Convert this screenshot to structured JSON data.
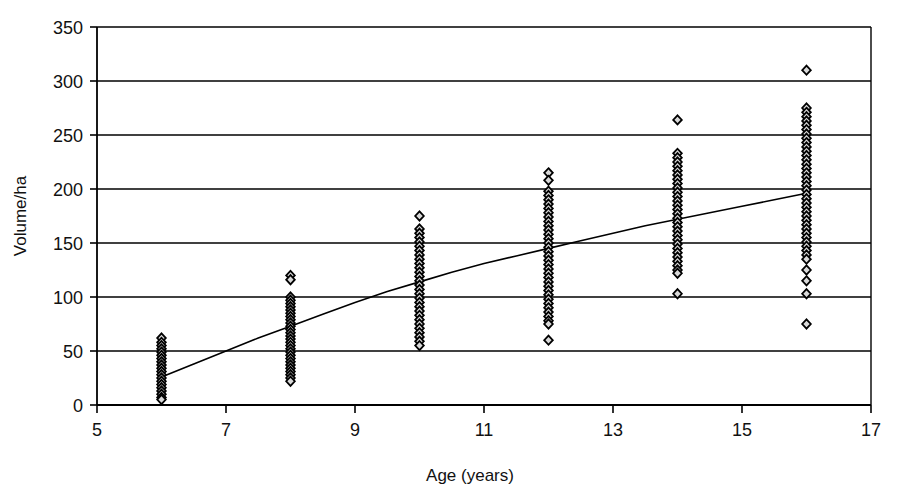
{
  "chart_data": {
    "type": "scatter",
    "title": "",
    "xlabel": "Age (years)",
    "ylabel": "Volume/ha",
    "xlim": [
      5,
      17
    ],
    "ylim": [
      0,
      350
    ],
    "xticks": [
      5,
      7,
      9,
      11,
      13,
      15,
      17
    ],
    "yticks": [
      0,
      50,
      100,
      150,
      200,
      250,
      300,
      350
    ],
    "xtick_labels": [
      "5",
      "7",
      "9",
      "11",
      "13",
      "15",
      "17"
    ],
    "ytick_labels": [
      "0",
      "50",
      "100",
      "150",
      "200",
      "250",
      "300",
      "350"
    ],
    "grid": "horizontal",
    "legend": "none",
    "marker": "diamond",
    "marker_fill": "#d9d9d9",
    "marker_edge": "#000000",
    "axis_color": "#000000",
    "grid_color": "#000000",
    "series": [
      {
        "name": "Volume per hectare by stand age",
        "type": "scatter",
        "points": [
          {
            "x": 6,
            "y": 62
          },
          {
            "x": 6,
            "y": 58
          },
          {
            "x": 6,
            "y": 55
          },
          {
            "x": 6,
            "y": 52
          },
          {
            "x": 6,
            "y": 49
          },
          {
            "x": 6,
            "y": 46
          },
          {
            "x": 6,
            "y": 43
          },
          {
            "x": 6,
            "y": 40
          },
          {
            "x": 6,
            "y": 37
          },
          {
            "x": 6,
            "y": 34
          },
          {
            "x": 6,
            "y": 31
          },
          {
            "x": 6,
            "y": 28
          },
          {
            "x": 6,
            "y": 25
          },
          {
            "x": 6,
            "y": 22
          },
          {
            "x": 6,
            "y": 19
          },
          {
            "x": 6,
            "y": 16
          },
          {
            "x": 6,
            "y": 13
          },
          {
            "x": 6,
            "y": 10
          },
          {
            "x": 6,
            "y": 7
          },
          {
            "x": 6,
            "y": 5
          },
          {
            "x": 8,
            "y": 120
          },
          {
            "x": 8,
            "y": 116
          },
          {
            "x": 8,
            "y": 100
          },
          {
            "x": 8,
            "y": 97
          },
          {
            "x": 8,
            "y": 94
          },
          {
            "x": 8,
            "y": 91
          },
          {
            "x": 8,
            "y": 88
          },
          {
            "x": 8,
            "y": 85
          },
          {
            "x": 8,
            "y": 82
          },
          {
            "x": 8,
            "y": 79
          },
          {
            "x": 8,
            "y": 76
          },
          {
            "x": 8,
            "y": 73
          },
          {
            "x": 8,
            "y": 70
          },
          {
            "x": 8,
            "y": 67
          },
          {
            "x": 8,
            "y": 64
          },
          {
            "x": 8,
            "y": 61
          },
          {
            "x": 8,
            "y": 58
          },
          {
            "x": 8,
            "y": 55
          },
          {
            "x": 8,
            "y": 52
          },
          {
            "x": 8,
            "y": 49
          },
          {
            "x": 8,
            "y": 46
          },
          {
            "x": 8,
            "y": 43
          },
          {
            "x": 8,
            "y": 40
          },
          {
            "x": 8,
            "y": 37
          },
          {
            "x": 8,
            "y": 34
          },
          {
            "x": 8,
            "y": 31
          },
          {
            "x": 8,
            "y": 28
          },
          {
            "x": 8,
            "y": 25
          },
          {
            "x": 8,
            "y": 22
          },
          {
            "x": 10,
            "y": 175
          },
          {
            "x": 10,
            "y": 163
          },
          {
            "x": 10,
            "y": 159
          },
          {
            "x": 10,
            "y": 155
          },
          {
            "x": 10,
            "y": 151
          },
          {
            "x": 10,
            "y": 147
          },
          {
            "x": 10,
            "y": 143
          },
          {
            "x": 10,
            "y": 139
          },
          {
            "x": 10,
            "y": 135
          },
          {
            "x": 10,
            "y": 131
          },
          {
            "x": 10,
            "y": 127
          },
          {
            "x": 10,
            "y": 123
          },
          {
            "x": 10,
            "y": 119
          },
          {
            "x": 10,
            "y": 115
          },
          {
            "x": 10,
            "y": 111
          },
          {
            "x": 10,
            "y": 107
          },
          {
            "x": 10,
            "y": 103
          },
          {
            "x": 10,
            "y": 99
          },
          {
            "x": 10,
            "y": 95
          },
          {
            "x": 10,
            "y": 91
          },
          {
            "x": 10,
            "y": 87
          },
          {
            "x": 10,
            "y": 83
          },
          {
            "x": 10,
            "y": 79
          },
          {
            "x": 10,
            "y": 75
          },
          {
            "x": 10,
            "y": 71
          },
          {
            "x": 10,
            "y": 67
          },
          {
            "x": 10,
            "y": 63
          },
          {
            "x": 10,
            "y": 59
          },
          {
            "x": 10,
            "y": 55
          },
          {
            "x": 12,
            "y": 215
          },
          {
            "x": 12,
            "y": 208
          },
          {
            "x": 12,
            "y": 198
          },
          {
            "x": 12,
            "y": 194
          },
          {
            "x": 12,
            "y": 190
          },
          {
            "x": 12,
            "y": 186
          },
          {
            "x": 12,
            "y": 182
          },
          {
            "x": 12,
            "y": 178
          },
          {
            "x": 12,
            "y": 174
          },
          {
            "x": 12,
            "y": 170
          },
          {
            "x": 12,
            "y": 166
          },
          {
            "x": 12,
            "y": 162
          },
          {
            "x": 12,
            "y": 158
          },
          {
            "x": 12,
            "y": 154
          },
          {
            "x": 12,
            "y": 150
          },
          {
            "x": 12,
            "y": 146
          },
          {
            "x": 12,
            "y": 142
          },
          {
            "x": 12,
            "y": 138
          },
          {
            "x": 12,
            "y": 134
          },
          {
            "x": 12,
            "y": 130
          },
          {
            "x": 12,
            "y": 126
          },
          {
            "x": 12,
            "y": 122
          },
          {
            "x": 12,
            "y": 118
          },
          {
            "x": 12,
            "y": 114
          },
          {
            "x": 12,
            "y": 110
          },
          {
            "x": 12,
            "y": 106
          },
          {
            "x": 12,
            "y": 102
          },
          {
            "x": 12,
            "y": 98
          },
          {
            "x": 12,
            "y": 94
          },
          {
            "x": 12,
            "y": 90
          },
          {
            "x": 12,
            "y": 86
          },
          {
            "x": 12,
            "y": 82
          },
          {
            "x": 12,
            "y": 78
          },
          {
            "x": 12,
            "y": 75
          },
          {
            "x": 12,
            "y": 60
          },
          {
            "x": 14,
            "y": 264
          },
          {
            "x": 14,
            "y": 233
          },
          {
            "x": 14,
            "y": 229
          },
          {
            "x": 14,
            "y": 225
          },
          {
            "x": 14,
            "y": 221
          },
          {
            "x": 14,
            "y": 217
          },
          {
            "x": 14,
            "y": 213
          },
          {
            "x": 14,
            "y": 209
          },
          {
            "x": 14,
            "y": 205
          },
          {
            "x": 14,
            "y": 201
          },
          {
            "x": 14,
            "y": 197
          },
          {
            "x": 14,
            "y": 193
          },
          {
            "x": 14,
            "y": 189
          },
          {
            "x": 14,
            "y": 185
          },
          {
            "x": 14,
            "y": 181
          },
          {
            "x": 14,
            "y": 177
          },
          {
            "x": 14,
            "y": 173
          },
          {
            "x": 14,
            "y": 169
          },
          {
            "x": 14,
            "y": 165
          },
          {
            "x": 14,
            "y": 161
          },
          {
            "x": 14,
            "y": 157
          },
          {
            "x": 14,
            "y": 153
          },
          {
            "x": 14,
            "y": 149
          },
          {
            "x": 14,
            "y": 145
          },
          {
            "x": 14,
            "y": 141
          },
          {
            "x": 14,
            "y": 137
          },
          {
            "x": 14,
            "y": 133
          },
          {
            "x": 14,
            "y": 129
          },
          {
            "x": 14,
            "y": 125
          },
          {
            "x": 14,
            "y": 122
          },
          {
            "x": 14,
            "y": 103
          },
          {
            "x": 16,
            "y": 310
          },
          {
            "x": 16,
            "y": 275
          },
          {
            "x": 16,
            "y": 271
          },
          {
            "x": 16,
            "y": 267
          },
          {
            "x": 16,
            "y": 263
          },
          {
            "x": 16,
            "y": 259
          },
          {
            "x": 16,
            "y": 255
          },
          {
            "x": 16,
            "y": 251
          },
          {
            "x": 16,
            "y": 247
          },
          {
            "x": 16,
            "y": 243
          },
          {
            "x": 16,
            "y": 239
          },
          {
            "x": 16,
            "y": 235
          },
          {
            "x": 16,
            "y": 231
          },
          {
            "x": 16,
            "y": 227
          },
          {
            "x": 16,
            "y": 223
          },
          {
            "x": 16,
            "y": 219
          },
          {
            "x": 16,
            "y": 215
          },
          {
            "x": 16,
            "y": 211
          },
          {
            "x": 16,
            "y": 207
          },
          {
            "x": 16,
            "y": 203
          },
          {
            "x": 16,
            "y": 199
          },
          {
            "x": 16,
            "y": 195
          },
          {
            "x": 16,
            "y": 191
          },
          {
            "x": 16,
            "y": 187
          },
          {
            "x": 16,
            "y": 183
          },
          {
            "x": 16,
            "y": 179
          },
          {
            "x": 16,
            "y": 175
          },
          {
            "x": 16,
            "y": 171
          },
          {
            "x": 16,
            "y": 167
          },
          {
            "x": 16,
            "y": 163
          },
          {
            "x": 16,
            "y": 159
          },
          {
            "x": 16,
            "y": 155
          },
          {
            "x": 16,
            "y": 151
          },
          {
            "x": 16,
            "y": 147
          },
          {
            "x": 16,
            "y": 143
          },
          {
            "x": 16,
            "y": 139
          },
          {
            "x": 16,
            "y": 135
          },
          {
            "x": 16,
            "y": 125
          },
          {
            "x": 16,
            "y": 115
          },
          {
            "x": 16,
            "y": 103
          },
          {
            "x": 16,
            "y": 75
          }
        ]
      }
    ],
    "trendline": {
      "name": "fitted growth curve",
      "type": "line",
      "color": "#000000",
      "points": [
        {
          "x": 6.0,
          "y": 26
        },
        {
          "x": 6.5,
          "y": 38
        },
        {
          "x": 7.0,
          "y": 50
        },
        {
          "x": 7.5,
          "y": 62
        },
        {
          "x": 8.0,
          "y": 73
        },
        {
          "x": 8.5,
          "y": 84
        },
        {
          "x": 9.0,
          "y": 95
        },
        {
          "x": 9.5,
          "y": 105
        },
        {
          "x": 10.0,
          "y": 114
        },
        {
          "x": 10.5,
          "y": 123
        },
        {
          "x": 11.0,
          "y": 131
        },
        {
          "x": 11.5,
          "y": 138
        },
        {
          "x": 12.0,
          "y": 145
        },
        {
          "x": 12.5,
          "y": 152
        },
        {
          "x": 13.0,
          "y": 159
        },
        {
          "x": 13.5,
          "y": 166
        },
        {
          "x": 14.0,
          "y": 172
        },
        {
          "x": 14.5,
          "y": 178
        },
        {
          "x": 15.0,
          "y": 184
        },
        {
          "x": 15.5,
          "y": 190
        },
        {
          "x": 16.0,
          "y": 196
        }
      ]
    }
  }
}
